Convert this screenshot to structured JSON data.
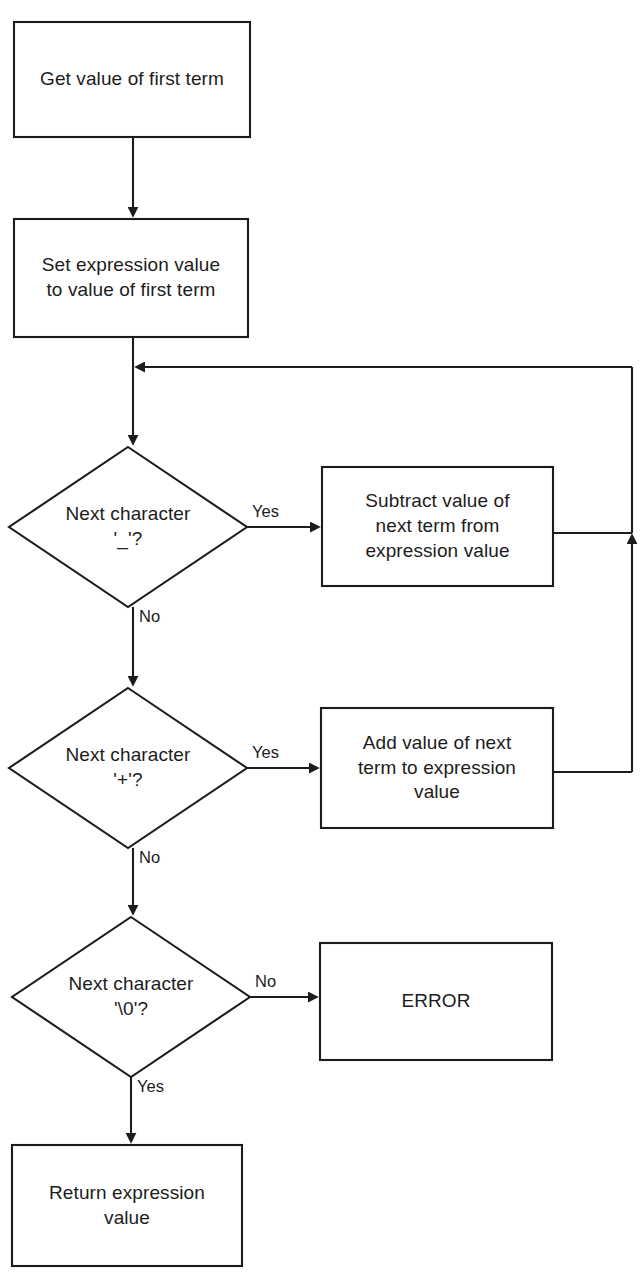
{
  "diagram": {
    "type": "flowchart",
    "stroke_color": "#1c1c1c",
    "fill_color": "#ffffff",
    "text_color": "#1c1c1c"
  },
  "nodes": {
    "get_first_term": {
      "shape": "process",
      "label": "Get value of first term"
    },
    "set_expression_value": {
      "shape": "process",
      "label": "Set expression value\nto value of first term"
    },
    "decide_minus": {
      "shape": "decision",
      "label": "Next character\n'_'?"
    },
    "subtract_term": {
      "shape": "process",
      "label": "Subtract value of\nnext term from\nexpression value"
    },
    "decide_plus": {
      "shape": "decision",
      "label": "Next character\n'+'?"
    },
    "add_term": {
      "shape": "process",
      "label": "Add value of next\nterm to expression\nvalue"
    },
    "decide_nul": {
      "shape": "decision",
      "label": "Next character\n'\\0'?"
    },
    "error": {
      "shape": "process",
      "label": "ERROR"
    },
    "return_value": {
      "shape": "process",
      "label": "Return expression\nvalue"
    }
  },
  "edge_labels": {
    "minus_yes": "Yes",
    "minus_no": "No",
    "plus_yes": "Yes",
    "plus_no": "No",
    "nul_no": "No",
    "nul_yes": "Yes"
  }
}
